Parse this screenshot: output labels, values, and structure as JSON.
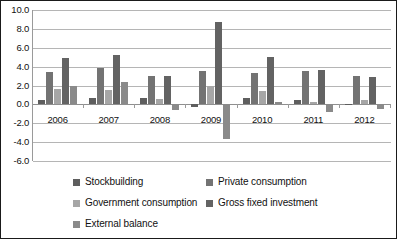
{
  "chart_data": {
    "type": "bar",
    "title": "",
    "subtitle": "",
    "xlabel": "",
    "ylabel": "",
    "ylim": [
      -6.0,
      10.0
    ],
    "ytick_step": 2.0,
    "grid": true,
    "legend_position": "bottom",
    "categories": [
      "2006",
      "2007",
      "2008",
      "2009",
      "2010",
      "2011",
      "2012"
    ],
    "ytick_labels": [
      "10.0",
      "8.0",
      "6.0",
      "4.0",
      "2.0",
      "0.0",
      "-2.0",
      "-4.0",
      "-6.0"
    ],
    "ytick_values": [
      10.0,
      8.0,
      6.0,
      4.0,
      2.0,
      0.0,
      -2.0,
      -4.0,
      -6.0
    ],
    "series": [
      {
        "name": "Stockbuilding",
        "color": "#5e5e5e",
        "values": [
          0.5,
          0.7,
          0.7,
          -0.3,
          0.7,
          0.5,
          -0.1
        ]
      },
      {
        "name": "Private consumption",
        "color": "#737373",
        "values": [
          3.4,
          3.9,
          3.0,
          3.5,
          3.3,
          3.5,
          3.0
        ]
      },
      {
        "name": "Government consumption",
        "color": "#a6a6a6",
        "values": [
          1.6,
          1.5,
          0.6,
          2.0,
          1.4,
          0.2,
          0.5
        ]
      },
      {
        "name": "Gross fixed investment",
        "color": "#636363",
        "values": [
          4.9,
          5.2,
          3.0,
          8.7,
          5.0,
          3.6,
          2.9
        ]
      },
      {
        "name": "External balance",
        "color": "#8a8a8a",
        "values": [
          1.9,
          2.4,
          -0.6,
          -3.7,
          0.3,
          -0.8,
          -0.5
        ]
      }
    ]
  },
  "legend": {
    "items": [
      {
        "label": "Stockbuilding"
      },
      {
        "label": "Private consumption"
      },
      {
        "label": "Government consumption"
      },
      {
        "label": "Gross fixed investment"
      },
      {
        "label": "External balance"
      }
    ]
  }
}
